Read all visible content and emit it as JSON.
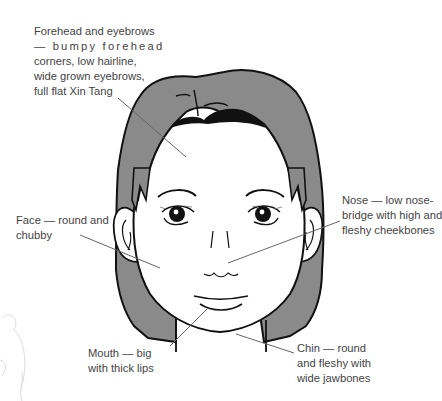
{
  "figure": {
    "colors": {
      "hair": "#8a8a8a",
      "outline": "#111111",
      "skin": "#ffffff",
      "leader_line": "#666666",
      "text": "#444444",
      "ghost_sketch": "#dddddd"
    }
  },
  "annotations": [
    {
      "id": "forehead",
      "lines": [
        "Forehead and eyebrows",
        "— bumpy forehead",
        "corners, low hairline,",
        "wide grown eyebrows,",
        "full flat Xin Tang"
      ]
    },
    {
      "id": "nose",
      "lines": [
        "Nose — low nose-",
        "bridge with high and",
        "fleshy cheekbones"
      ]
    },
    {
      "id": "face",
      "lines": [
        "Face — round and",
        "chubby"
      ]
    },
    {
      "id": "mouth",
      "lines": [
        "Mouth — big",
        "with thick lips"
      ]
    },
    {
      "id": "chin",
      "lines": [
        "Chin — round",
        "and fleshy with",
        "wide jawbones"
      ]
    }
  ]
}
